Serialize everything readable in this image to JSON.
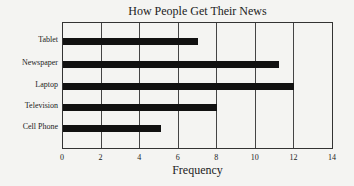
{
  "chart_data": {
    "type": "bar",
    "orientation": "horizontal",
    "title": "How People Get Their News",
    "xlabel": "Frequency",
    "ylabel": "",
    "categories": [
      "Tablet",
      "Newspaper",
      "Laptop",
      "Television",
      "Cell Phone"
    ],
    "values": [
      7,
      11.2,
      12,
      8,
      5.1
    ],
    "xlim": [
      0,
      14
    ],
    "xticks": [
      "0",
      "2",
      "4",
      "6",
      "8",
      "10",
      "12",
      "14"
    ],
    "grid": true,
    "legend": null,
    "bar_color": "#111111"
  }
}
